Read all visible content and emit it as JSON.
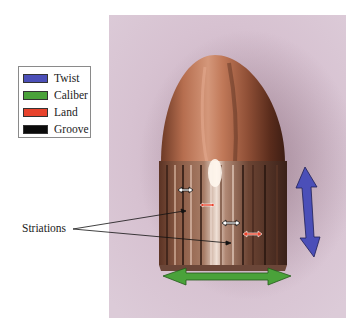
{
  "legend": {
    "items": [
      {
        "label": "Twist",
        "color": "#4b4fb8"
      },
      {
        "label": "Caliber",
        "color": "#4aa23a"
      },
      {
        "label": "Land",
        "color": "#e8432c"
      },
      {
        "label": "Groove",
        "color": "#0b0b0b"
      }
    ]
  },
  "callout": {
    "label": "Striations"
  },
  "photo": {
    "subject": "fired bullet with rifling marks",
    "background_color": "#d8c3d2",
    "bullet_color": "#b0684a"
  },
  "annotations": {
    "twist_arrow": {
      "color": "#4b4fb8",
      "orientation": "vertical"
    },
    "caliber_arrow": {
      "color": "#4aa23a",
      "orientation": "horizontal"
    },
    "land_markers": {
      "color": "#e8432c",
      "count": 2
    },
    "groove_markers": {
      "color": "#ffffff",
      "outline": "#111111",
      "count": 2
    }
  }
}
